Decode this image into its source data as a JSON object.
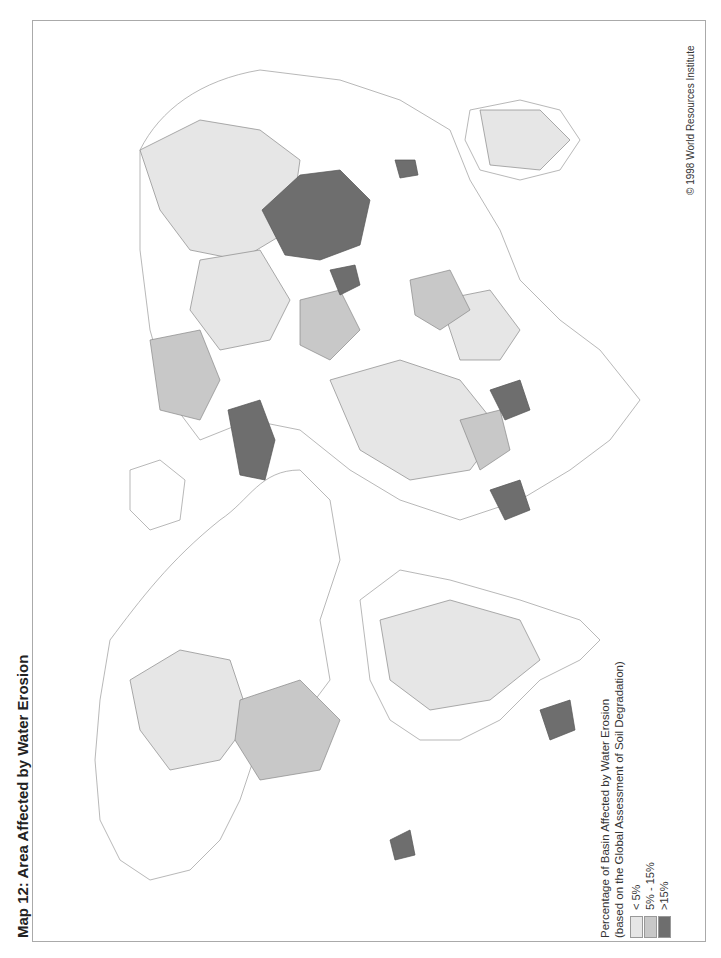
{
  "title": "Map 12: Area Affected by Water Erosion",
  "copyright": "© 1998 World Resources Institute",
  "legend": {
    "title_line1": "Percentage of Basin Affected by Water Erosion",
    "title_line2": "(based on the Global Assessment of Soil Degradation)",
    "items": [
      {
        "label": "< 5%",
        "color": "#e6e6e6"
      },
      {
        "label": "5% - 15%",
        "color": "#c8c8c8"
      },
      {
        "label": ">15%",
        "color": "#6e6e6e"
      }
    ]
  },
  "map": {
    "orientation": "rotated 90° counter-clockwise (north points left)",
    "colors": {
      "low": "#e6e6e6",
      "mid": "#c8c8c8",
      "high": "#6e6e6e",
      "outline": "#888888",
      "land_outline": "#aaaaaa"
    }
  }
}
